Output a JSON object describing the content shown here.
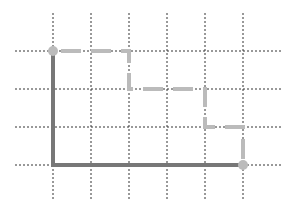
{
  "canvas": {
    "width": 295,
    "height": 213,
    "background": "#ffffff"
  },
  "grid": {
    "columns_x": [
      53,
      91,
      129,
      167,
      205,
      243
    ],
    "rows_y": [
      51,
      89,
      127,
      165
    ],
    "vertical_extent": [
      13,
      200
    ],
    "horizontal_extent": [
      15,
      283
    ],
    "color": "#333333",
    "style": "dotted"
  },
  "paths": {
    "solid": {
      "label": "direct-route",
      "color": "#777777",
      "width": 4,
      "points": [
        [
          53,
          51
        ],
        [
          53,
          165
        ],
        [
          243,
          165
        ]
      ]
    },
    "dashed": {
      "label": "staircase-route",
      "color": "#bbbbbb",
      "width": 4,
      "dash": "20 10",
      "points": [
        [
          53,
          51
        ],
        [
          129,
          51
        ],
        [
          129,
          89
        ],
        [
          205,
          89
        ],
        [
          205,
          127
        ],
        [
          243,
          127
        ],
        [
          243,
          165
        ]
      ]
    }
  },
  "endpoints": {
    "start": {
      "x": 53,
      "y": 51,
      "r": 5,
      "color": "#bbbbbb"
    },
    "end": {
      "x": 243,
      "y": 165,
      "r": 5,
      "color": "#bbbbbb"
    }
  }
}
